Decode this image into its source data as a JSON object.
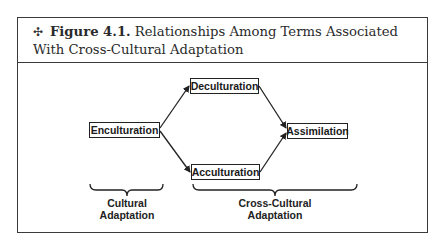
{
  "caption": {
    "icon": "diamond-star-icon",
    "figure_label": "Figure 4.1.",
    "title": " Relationships Among Terms Associated With Cross-Cultural Adaptation"
  },
  "nodes": {
    "enculturation": "Enculturation",
    "deculturation": "Deculturation",
    "acculturation": "Acculturation",
    "assimilation": "Assimilation"
  },
  "edges": [
    {
      "from": "Enculturation",
      "to": "Deculturation"
    },
    {
      "from": "Enculturation",
      "to": "Acculturation"
    },
    {
      "from": "Deculturation",
      "to": "Assimilation"
    },
    {
      "from": "Acculturation",
      "to": "Assimilation"
    }
  ],
  "groups": {
    "cultural": {
      "line1": "Cultural",
      "line2": "Adaptation"
    },
    "cross_cultural": {
      "line1": "Cross-Cultural",
      "line2": "Adaptation"
    }
  },
  "colors": {
    "ink": "#222222",
    "background": "#ffffff"
  }
}
